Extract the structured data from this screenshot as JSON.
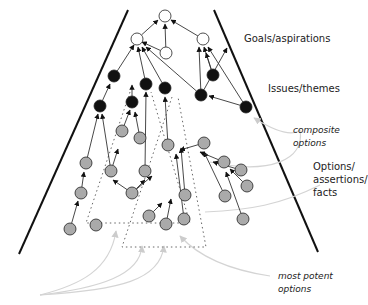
{
  "labels": {
    "goals": "Goals/aspirations",
    "issues": "Issues/themes",
    "composite": "composite options",
    "options": "Options/\nassertions/\nfacts",
    "potent": "most potent options"
  },
  "colors": {
    "goal_fill": "#ffffff",
    "issue_fill": "#111111",
    "option_fill": "#aaaaaa",
    "stroke": "#222222",
    "annotation": "#cccccc"
  },
  "nodes": {
    "goals": [
      [
        165,
        16
      ],
      [
        137,
        39
      ],
      [
        203,
        39
      ],
      [
        166,
        53
      ]
    ],
    "issues": [
      [
        114,
        76
      ],
      [
        146,
        84
      ],
      [
        165,
        88
      ],
      [
        213,
        75
      ],
      [
        201,
        95
      ],
      [
        246,
        107
      ],
      [
        100,
        106
      ],
      [
        132,
        102
      ]
    ],
    "options": [
      [
        122,
        131
      ],
      [
        140,
        138
      ],
      [
        168,
        145
      ],
      [
        204,
        143
      ],
      [
        86,
        163
      ],
      [
        111,
        171
      ],
      [
        145,
        171
      ],
      [
        224,
        162
      ],
      [
        241,
        170
      ],
      [
        81,
        193
      ],
      [
        132,
        193
      ],
      [
        225,
        196
      ],
      [
        96,
        225
      ],
      [
        149,
        216
      ],
      [
        185,
        195
      ],
      [
        247,
        186
      ],
      [
        70,
        229
      ],
      [
        166,
        224
      ],
      [
        184,
        219
      ],
      [
        243,
        219
      ]
    ]
  },
  "edges": [
    [
      114,
      76,
      134,
      45
    ],
    [
      146,
      84,
      138,
      47
    ],
    [
      165,
      88,
      142,
      47
    ],
    [
      201,
      95,
      146,
      47
    ],
    [
      166,
      53,
      142,
      42
    ],
    [
      166,
      53,
      165,
      24
    ],
    [
      137,
      39,
      158,
      20
    ],
    [
      203,
      39,
      171,
      20
    ],
    [
      201,
      95,
      199,
      47
    ],
    [
      213,
      75,
      204,
      47
    ],
    [
      246,
      107,
      208,
      47
    ],
    [
      201,
      95,
      227,
      48
    ],
    [
      100,
      106,
      110,
      84
    ],
    [
      132,
      102,
      132,
      85
    ],
    [
      246,
      107,
      209,
      96
    ],
    [
      213,
      75,
      206,
      53
    ],
    [
      122,
      131,
      130,
      110
    ],
    [
      140,
      138,
      135,
      112
    ],
    [
      86,
      163,
      98,
      114
    ],
    [
      111,
      171,
      102,
      114
    ],
    [
      168,
      145,
      165,
      97
    ],
    [
      145,
      171,
      146,
      92
    ],
    [
      81,
      193,
      84,
      172
    ],
    [
      132,
      193,
      113,
      180
    ],
    [
      132,
      193,
      145,
      180
    ],
    [
      132,
      193,
      152,
      176
    ],
    [
      70,
      229,
      78,
      201
    ],
    [
      111,
      171,
      118,
      149
    ],
    [
      185,
      195,
      181,
      148
    ],
    [
      166,
      224,
      171,
      199
    ],
    [
      184,
      219,
      176,
      154
    ],
    [
      149,
      216,
      162,
      203
    ],
    [
      225,
      196,
      204,
      152
    ],
    [
      243,
      219,
      226,
      172
    ],
    [
      204,
      143,
      180,
      150
    ],
    [
      224,
      162,
      200,
      152
    ],
    [
      241,
      170,
      213,
      162
    ],
    [
      247,
      186,
      230,
      169
    ]
  ],
  "dotted_boxes": [
    [
      [
        130,
        90
      ],
      [
        88,
        222
      ],
      [
        190,
        222
      ],
      [
        155,
        90
      ]
    ],
    [
      [
        175,
        97
      ],
      [
        122,
        246
      ],
      [
        206,
        246
      ],
      [
        175,
        97
      ]
    ]
  ]
}
